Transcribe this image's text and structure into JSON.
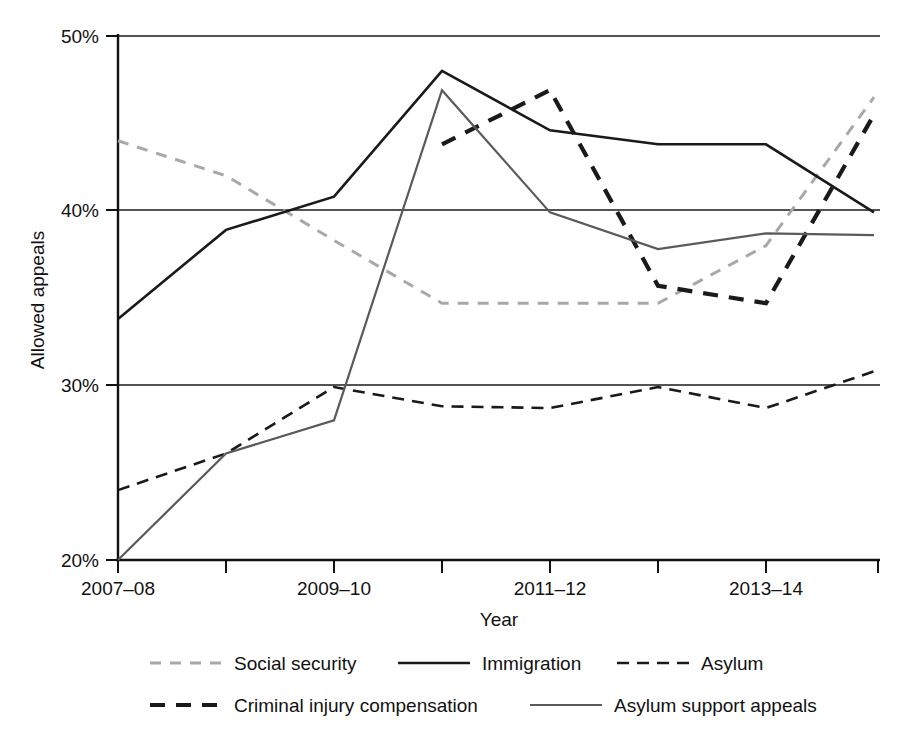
{
  "chart_data": {
    "type": "line",
    "title": "",
    "xlabel": "Year",
    "ylabel": "Allowed appeals",
    "x": [
      "2007-08",
      "2008-09",
      "2009-10",
      "2010-11",
      "2011-12",
      "2012-13",
      "2013-14",
      "2014-15"
    ],
    "categories": [
      "2007-08",
      "2008-09",
      "2009-10",
      "2010-11",
      "2011-12",
      "2012-13",
      "2013-14",
      "2014-15"
    ],
    "xtick_labels": [
      "2007–08",
      "",
      "2009–10",
      "",
      "2011–12",
      "",
      "2013–14",
      ""
    ],
    "ytick_labels": [
      "20%",
      "30%",
      "40%",
      "50%"
    ],
    "ytick_values": [
      20,
      30,
      40,
      50
    ],
    "ylim": [
      20,
      50
    ],
    "grid": "horizontal",
    "legend_position": "bottom",
    "series": [
      {
        "name": "Social security",
        "style": "dashed",
        "color": "#a8a8a8",
        "width": 3.0,
        "dash": "11,9",
        "values": [
          44.0,
          42.0,
          38.3,
          34.7,
          34.7,
          34.7,
          38.0,
          46.5
        ]
      },
      {
        "name": "Immigration",
        "style": "solid",
        "color": "#1a1a1a",
        "width": 2.6,
        "dash": "",
        "values": [
          33.8,
          38.9,
          40.8,
          48.0,
          44.6,
          43.8,
          43.8,
          39.9
        ]
      },
      {
        "name": "Asylum",
        "style": "dashed",
        "color": "#1a1a1a",
        "width": 2.6,
        "dash": "12,8",
        "values": [
          24.0,
          26.1,
          29.9,
          28.8,
          28.7,
          29.9,
          28.7,
          30.8
        ]
      },
      {
        "name": "Criminal injury compensation",
        "style": "dashed",
        "color": "#1a1a1a",
        "width": 4.2,
        "dash": "15,11",
        "values": [
          null,
          null,
          null,
          43.8,
          46.9,
          35.7,
          34.7,
          45.5
        ]
      },
      {
        "name": "Asylum support appeals",
        "style": "solid",
        "color": "#5a5a5a",
        "width": 2.2,
        "dash": "",
        "values": [
          20.0,
          26.1,
          28.0,
          46.9,
          39.9,
          37.8,
          38.7,
          38.6
        ]
      }
    ]
  },
  "axes": {
    "y_title": "Allowed appeals",
    "x_title": "Year"
  },
  "legend": {
    "row1": [
      {
        "label": "Social security",
        "key": "legend-swatch-social-security"
      },
      {
        "label": "Immigration",
        "key": "legend-swatch-immigration"
      },
      {
        "label": "Asylum",
        "key": "legend-swatch-asylum"
      }
    ],
    "row2": [
      {
        "label": "Criminal injury compensation",
        "key": "legend-swatch-criminal-injury-compensation"
      },
      {
        "label": "Asylum support appeals",
        "key": "legend-swatch-asylum-support-appeals"
      }
    ]
  }
}
